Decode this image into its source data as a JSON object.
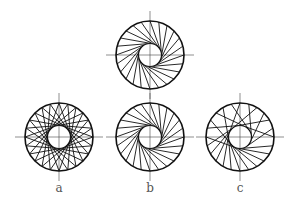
{
  "figure": {
    "background": "#ffffff",
    "stroke_color": "#111111",
    "axis_color": "#444444",
    "outer_radius": 34,
    "inner_radius": 11.5,
    "diagrams": [
      {
        "id": "top",
        "cx": 150,
        "cy": 55,
        "chords": 24,
        "mode": "tangent",
        "direction": 1,
        "label": ""
      },
      {
        "id": "a",
        "cx": 59,
        "cy": 137,
        "chords": 24,
        "mode": "tangent-both",
        "direction": 1,
        "label": "a"
      },
      {
        "id": "b",
        "cx": 150,
        "cy": 137,
        "chords": 24,
        "mode": "tangent",
        "direction": 1,
        "label": "b"
      },
      {
        "id": "c",
        "cx": 240,
        "cy": 137,
        "chords": 24,
        "mode": "irregular",
        "direction": 1,
        "label": "c"
      }
    ]
  },
  "labels": {
    "a": "a",
    "b": "b",
    "c": "c"
  }
}
